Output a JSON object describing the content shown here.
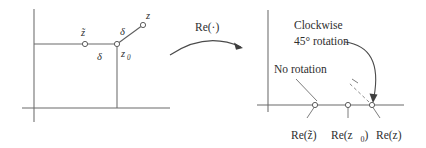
{
  "figure": {
    "caption_type": "complex-plane-mapping-diagram",
    "left_panel": {
      "name": "complex plane before Re(.)",
      "points": [
        {
          "id": "z_tilde",
          "label": "z̃",
          "label_plain": "ztilde",
          "x": 85,
          "y": 44,
          "label_x": 82,
          "label_y": 33
        },
        {
          "id": "z_zero",
          "label": "z",
          "sub": "0",
          "x": 117,
          "y": 44,
          "label_x": 122,
          "label_y": 56
        },
        {
          "id": "z",
          "label": "z",
          "x": 143,
          "y": 25,
          "label_x": 146,
          "label_y": 17
        }
      ],
      "distance_labels": [
        {
          "id": "delta_horizontal",
          "label": "δ",
          "x": 99,
          "y": 58
        },
        {
          "id": "delta_diagonal",
          "label": "δ",
          "x": 124,
          "y": 32
        }
      ]
    },
    "map_arrow": {
      "label": "Re(·)",
      "label_x": 212,
      "label_y": 31
    },
    "right_panel": {
      "name": "real line after Re(.)",
      "annotations": [
        {
          "id": "clockwise-rotation",
          "line1": "Clockwise",
          "line2": "45° rotation",
          "x": 294,
          "y": 27
        },
        {
          "id": "no-rotation",
          "line1": "No rotation",
          "x": 276,
          "y": 70
        }
      ],
      "points": [
        {
          "id": "re_z_tilde",
          "label": "Re(z̃)",
          "x": 315,
          "y": 105,
          "label_x": 293,
          "label_y": 136
        },
        {
          "id": "re_z_zero",
          "label": "Re(z",
          "sub": "0",
          "tail": ")",
          "x": 348,
          "y": 105,
          "label_x": 333,
          "label_y": 136
        },
        {
          "id": "re_z",
          "label": "Re(z)",
          "x": 372,
          "y": 105,
          "label_x": 381,
          "label_y": 136
        }
      ]
    },
    "colors": {
      "ink": "#2e2e2e",
      "line": "#6b6b6b",
      "dashed": "#8a8a8a",
      "background": "#ffffff"
    }
  }
}
